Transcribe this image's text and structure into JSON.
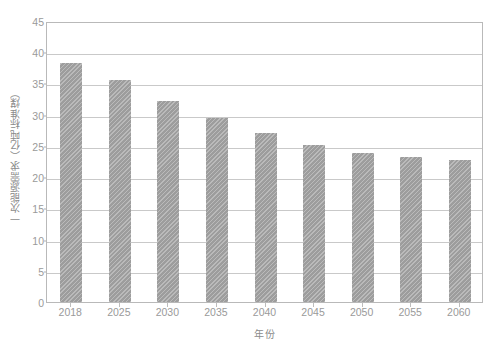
{
  "chart_data": {
    "type": "bar",
    "title": "",
    "subtitle": "",
    "xlabel": "年份",
    "ylabel": "一次能源需求（亿吨标准煤）",
    "categories": [
      "2018",
      "2025",
      "2030",
      "2035",
      "2040",
      "2045",
      "2050",
      "2055",
      "2060"
    ],
    "values": [
      38.2,
      35.6,
      32.2,
      29.5,
      27.1,
      25.2,
      23.9,
      23.2,
      22.8
    ],
    "series": [
      {
        "name": "一次能源需求",
        "values": [
          38.2,
          35.6,
          32.2,
          29.5,
          27.1,
          25.2,
          23.9,
          23.2,
          22.8
        ]
      }
    ],
    "ylim": [
      0,
      45
    ],
    "yticks": [
      0,
      5,
      10,
      15,
      20,
      25,
      30,
      35,
      40,
      45
    ],
    "ytick_labels": [
      "0",
      "5",
      "10",
      "15",
      "20",
      "25",
      "30",
      "35",
      "40",
      "45"
    ],
    "grid": true,
    "grid_axis": "y",
    "legend": false,
    "legend_position": "none",
    "bar_color": "#9d9d9d",
    "bar_hatch": "diagonal",
    "grid_color": "#c9c9c9",
    "axis_color": "#b9b9b9",
    "text_color": "#9a9a9a",
    "background": "#ffffff"
  }
}
